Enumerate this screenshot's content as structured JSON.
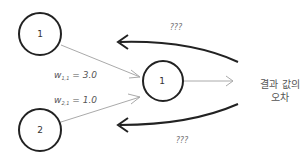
{
  "diagram": {
    "nodes": [
      {
        "id": "input-1",
        "label": "1"
      },
      {
        "id": "input-2",
        "label": "2"
      },
      {
        "id": "output-1",
        "label": "1"
      }
    ],
    "edges": [
      {
        "from": "input-1",
        "to": "output-1",
        "weight_symbol": "w",
        "weight_subscript": "1,1",
        "weight_value": "= 3.0"
      },
      {
        "from": "input-2",
        "to": "output-1",
        "weight_symbol": "w",
        "weight_subscript": "2,1",
        "weight_value": "= 1.0"
      }
    ],
    "output_arrow_label_line1": "결과 값의",
    "output_arrow_label_line2": "오차",
    "backprop_arrows": [
      {
        "label": "???"
      },
      {
        "label": "???"
      }
    ]
  }
}
